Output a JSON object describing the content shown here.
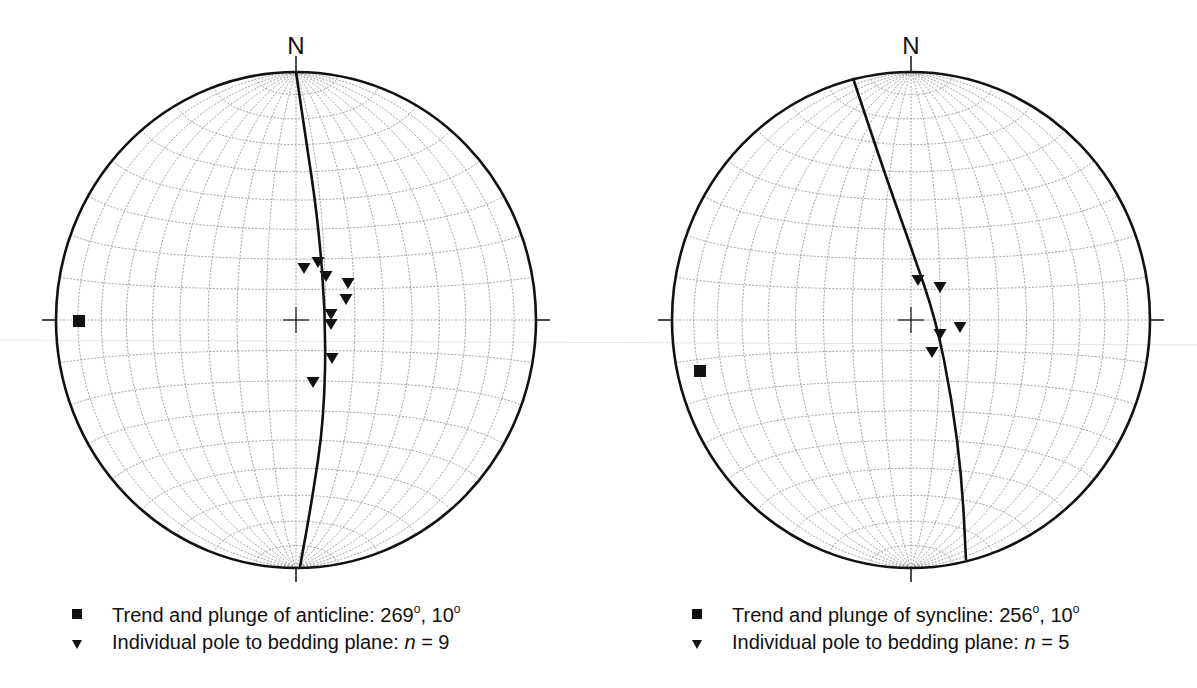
{
  "chart_data": [
    {
      "type": "scatter",
      "projection": "lower-hemisphere equal-area (Schmidt) stereonet",
      "north_label": "N",
      "net": {
        "cx": 296,
        "cy": 320,
        "rx": 240,
        "ry": 248,
        "grid_interval_deg": 10
      },
      "great_circle": {
        "description": "best-fit girdle (near N-S, slightly curved)",
        "strike_deg": 359,
        "dip_deg": 80
      },
      "fold_axis": {
        "symbol": "square",
        "trend_deg": 269,
        "plunge_deg": 10
      },
      "poles": {
        "symbol": "triangle-down",
        "n": 9,
        "points_px": [
          [
            304,
            268
          ],
          [
            318,
            262
          ],
          [
            326,
            276
          ],
          [
            348,
            283
          ],
          [
            346,
            299
          ],
          [
            331,
            314
          ],
          [
            331,
            324
          ],
          [
            332,
            358
          ],
          [
            313,
            382
          ]
        ]
      },
      "legend": [
        {
          "symbol": "square",
          "text": "Trend and plunge of anticline: 269",
          "sup1": "o",
          "mid": ", 10",
          "sup2": "o"
        },
        {
          "symbol": "triangle",
          "text": "Individual pole to bedding plane: ",
          "n_var": "n",
          "n_text": " = 9"
        }
      ]
    },
    {
      "type": "scatter",
      "projection": "lower-hemisphere equal-area (Schmidt) stereonet",
      "north_label": "N",
      "net": {
        "cx": 911,
        "cy": 320,
        "rx": 239,
        "ry": 248,
        "grid_interval_deg": 10
      },
      "great_circle": {
        "description": "best-fit girdle (NNW-SSE, curved)",
        "strike_deg": 346,
        "dip_deg": 80
      },
      "fold_axis": {
        "symbol": "square",
        "trend_deg": 256,
        "plunge_deg": 10
      },
      "poles": {
        "symbol": "triangle-down",
        "n": 5,
        "points_px": [
          [
            918,
            280
          ],
          [
            940,
            287
          ],
          [
            960,
            327
          ],
          [
            940,
            334
          ],
          [
            932,
            352
          ]
        ]
      },
      "legend": [
        {
          "symbol": "square",
          "text": "Trend and plunge of syncline: 256",
          "sup1": "o",
          "mid": ", 10",
          "sup2": "o"
        },
        {
          "symbol": "triangle",
          "text": "Individual pole to bedding plane: ",
          "n_var": "n",
          "n_text": " = 5"
        }
      ]
    }
  ],
  "colors": {
    "ink": "#111111",
    "grid": "#8a8a8a",
    "background": "#ffffff"
  },
  "fold_axis_px": [
    [
      79,
      321
    ],
    [
      700,
      371
    ]
  ],
  "girdle_px": [
    [
      [
        296,
        72
      ],
      [
        306,
        140
      ],
      [
        318,
        220
      ],
      [
        326,
        320
      ],
      [
        324,
        420
      ],
      [
        312,
        500
      ],
      [
        300,
        567
      ]
    ],
    [
      [
        853,
        78
      ],
      [
        880,
        160
      ],
      [
        912,
        250
      ],
      [
        936,
        320
      ],
      [
        952,
        400
      ],
      [
        962,
        480
      ],
      [
        966,
        560
      ]
    ]
  ]
}
